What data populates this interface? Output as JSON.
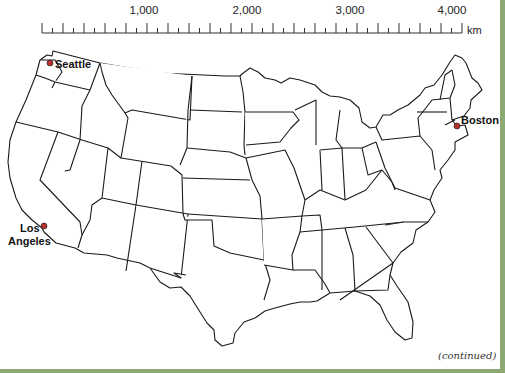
{
  "scale": {
    "labels": [
      {
        "text": "1,000",
        "x": 144
      },
      {
        "text": "2,000",
        "x": 247
      },
      {
        "text": "3,000",
        "x": 350
      },
      {
        "text": "4,000",
        "x": 452
      }
    ],
    "unit": "km",
    "start_x": 42,
    "end_x": 462,
    "max_km": 4000
  },
  "cities": [
    {
      "name": "Seattle",
      "dot_color": "#b5312c"
    },
    {
      "name": "Boston",
      "dot_color": "#b5312c"
    },
    {
      "name": "Los Angeles",
      "line1": "Los",
      "line2": "Angeles",
      "dot_color": "#b5312c"
    }
  ],
  "footer": {
    "continued": "(continued)"
  },
  "colors": {
    "border": "#8ca873",
    "outline": "#1a1a1a",
    "city_dot": "#b5312c"
  }
}
